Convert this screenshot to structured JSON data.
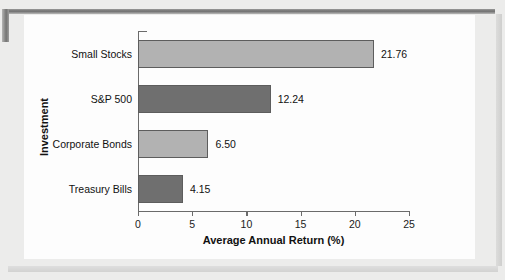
{
  "chart_data": {
    "type": "bar",
    "orientation": "horizontal",
    "title": "",
    "xlabel": "Average Annual Return (%)",
    "ylabel": "Investment",
    "categories": [
      "Small Stocks",
      "S&P 500",
      "Corporate Bonds",
      "Treasury Bills"
    ],
    "values": [
      21.76,
      12.24,
      6.5,
      4.15
    ],
    "value_labels": [
      "21.76",
      "12.24",
      "6.50",
      "4.15"
    ],
    "bar_colors": [
      "#b2b2b2",
      "#6f6f6f",
      "#b2b2b2",
      "#6f6f6f"
    ],
    "bar_border_color": "#5d5d5d",
    "xlim": [
      0,
      25
    ],
    "xticks": [
      0,
      5,
      10,
      15,
      20,
      25
    ],
    "xtick_labels": [
      "0",
      "5",
      "10",
      "15",
      "20",
      "25"
    ],
    "grid": false,
    "legend": false
  },
  "axis": {
    "ticks": [
      {
        "label": "0"
      },
      {
        "label": "5"
      },
      {
        "label": "10"
      },
      {
        "label": "15"
      },
      {
        "label": "20"
      },
      {
        "label": "25"
      }
    ]
  },
  "bars": [
    {
      "category": "Small Stocks",
      "value": 21.76,
      "label": "21.76"
    },
    {
      "category": "S&P 500",
      "value": 12.24,
      "label": "12.24"
    },
    {
      "category": "Corporate Bonds",
      "value": 6.5,
      "label": "6.50"
    },
    {
      "category": "Treasury Bills",
      "value": 4.15,
      "label": "4.15"
    }
  ],
  "titles": {
    "x_axis": "Average Annual Return (%)",
    "y_axis": "Investment"
  }
}
